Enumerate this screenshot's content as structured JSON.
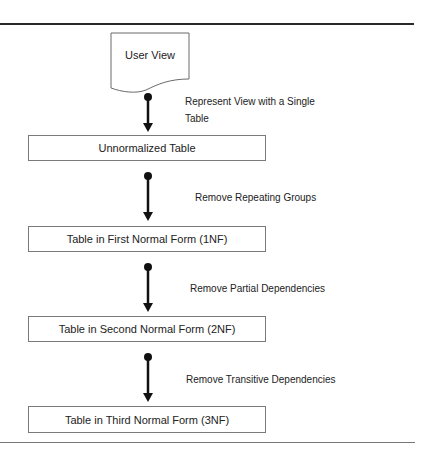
{
  "diagram": {
    "start": {
      "label": "User View",
      "shape": "document"
    },
    "stages": [
      {
        "label": "Unnormalized Table"
      },
      {
        "label": "Table in First Normal Form (1NF)"
      },
      {
        "label": "Table in Second Normal Form (2NF)"
      },
      {
        "label": "Table in Third Normal Form (3NF)"
      }
    ],
    "transitions": [
      {
        "line1": "Represent View with a Single",
        "line2": "Table"
      },
      {
        "line1": "Remove Repeating Groups",
        "line2": ""
      },
      {
        "line1": "Remove Partial Dependencies",
        "line2": ""
      },
      {
        "line1": "Remove Transitive Dependencies",
        "line2": ""
      }
    ],
    "colors": {
      "stroke": "#222222",
      "box_border": "#7a7a7a",
      "rule": "#2a2a2a",
      "background": "#ffffff"
    }
  }
}
